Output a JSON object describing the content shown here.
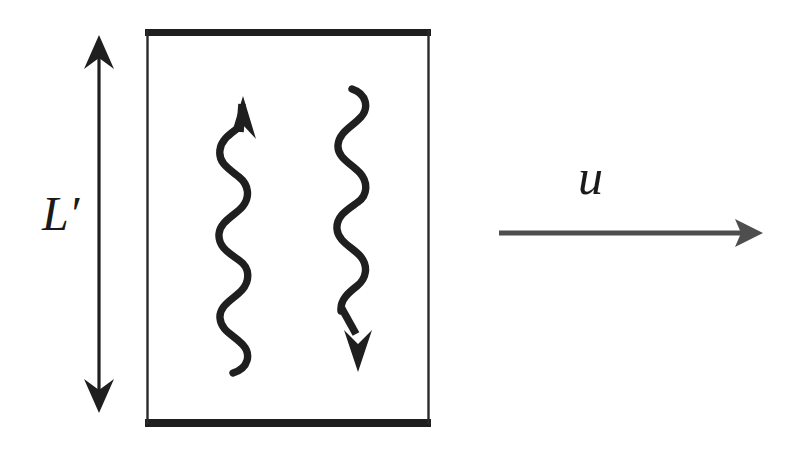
{
  "figure": {
    "domain": "diagram",
    "background_color": "#ffffff",
    "ink_color": "#1a1a1a",
    "canvas": {
      "width": 794,
      "height": 451
    }
  },
  "labels": {
    "height_label": {
      "text": "L′",
      "name": "L-prime",
      "meaning": "layer height",
      "color": "#1a1a1a"
    },
    "velocity_label": {
      "text": "u",
      "name": "u",
      "meaning": "mean flow velocity",
      "color": "#1a1a1a"
    }
  },
  "shapes": {
    "box": {
      "name": "fluid-layer-box",
      "left": 147,
      "top": 30,
      "right": 429,
      "bottom": 424,
      "top_edge_thickness": 7,
      "bottom_edge_thickness": 7,
      "side_edge_thickness": 2,
      "fill": "none",
      "stroke": "#1a1a1a"
    },
    "height_arrow": {
      "name": "height-double-arrow",
      "x": 99,
      "y_top": 36,
      "y_bottom": 412,
      "direction": "both",
      "stroke_width": 3
    },
    "wavy_arrow_up": {
      "name": "wavy-arrow-up",
      "x_center": 238,
      "y_head": 97,
      "y_tail": 373,
      "direction": "up",
      "wave_amplitude": 14,
      "wave_cycles": 4.5,
      "stroke_width": 7
    },
    "wavy_arrow_down": {
      "name": "wavy-arrow-down",
      "x_center": 359,
      "y_head": 371,
      "y_tail": 88,
      "direction": "down",
      "wave_amplitude": 15,
      "wave_cycles": 4.5,
      "stroke_width": 7
    },
    "velocity_arrow": {
      "name": "velocity-arrow",
      "x_start": 498,
      "x_end": 762,
      "y": 233,
      "direction": "right",
      "stroke_width": 5,
      "color": "#4a4a4a"
    }
  }
}
